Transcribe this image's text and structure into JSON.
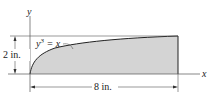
{
  "diagram": {
    "axes": {
      "x_label": "x",
      "y_label": "y"
    },
    "curve": {
      "equation_lhs": "y",
      "equation_exp": "3",
      "equation_rhs": " = x"
    },
    "dimensions": {
      "height": "2 in.",
      "width": "8 in."
    },
    "colors": {
      "fill": "#d4d4d4",
      "stroke": "#222222",
      "line": "#555555"
    }
  }
}
